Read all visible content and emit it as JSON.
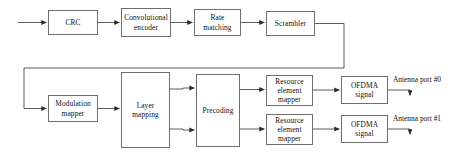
{
  "diagram": {
    "type": "block-diagram",
    "stroke_color": "#6f6f6f",
    "line_color": "#4a4a4a",
    "text_color": "#111111",
    "background_color": "#ffffff",
    "nodes": [
      {
        "id": "crc",
        "label": "CRC",
        "x": 48,
        "y": 10,
        "w": 50,
        "h": 25
      },
      {
        "id": "conv_enc",
        "label": "Convolutional\nencoder",
        "x": 121,
        "y": 8,
        "w": 50,
        "h": 29
      },
      {
        "id": "rate_match",
        "label": "Rate\nmatching",
        "x": 194,
        "y": 9,
        "w": 47,
        "h": 27
      },
      {
        "id": "scrambler",
        "label": "Scrambler",
        "x": 266,
        "y": 11,
        "w": 49,
        "h": 25
      },
      {
        "id": "mod_mapper",
        "label": "Modulation\nmapper",
        "x": 48,
        "y": 95,
        "w": 50,
        "h": 27
      },
      {
        "id": "layer_map",
        "label": "Layer\nmapping",
        "x": 121,
        "y": 72,
        "w": 49,
        "h": 76
      },
      {
        "id": "precoding",
        "label": "Precoding",
        "x": 196,
        "y": 74,
        "w": 44,
        "h": 73
      },
      {
        "id": "re_map_0",
        "label": "Resource\nelement\nmapper",
        "x": 266,
        "y": 75,
        "w": 47,
        "h": 31
      },
      {
        "id": "re_map_1",
        "label": "Resource\nelement\nmapper",
        "x": 266,
        "y": 114,
        "w": 47,
        "h": 31
      },
      {
        "id": "ofdma_0",
        "label": "OFDMA\nsignal",
        "x": 341,
        "y": 76,
        "w": 47,
        "h": 28
      },
      {
        "id": "ofdma_1",
        "label": "OFDMA\nsignal",
        "x": 341,
        "y": 115,
        "w": 47,
        "h": 28
      }
    ],
    "edge_labels": [
      {
        "id": "antenna_port_0",
        "text": "Antenna port #0",
        "x": 393,
        "y": 76
      },
      {
        "id": "antenna_port_1",
        "text": "Antenna port #1",
        "x": 393,
        "y": 115
      }
    ]
  }
}
